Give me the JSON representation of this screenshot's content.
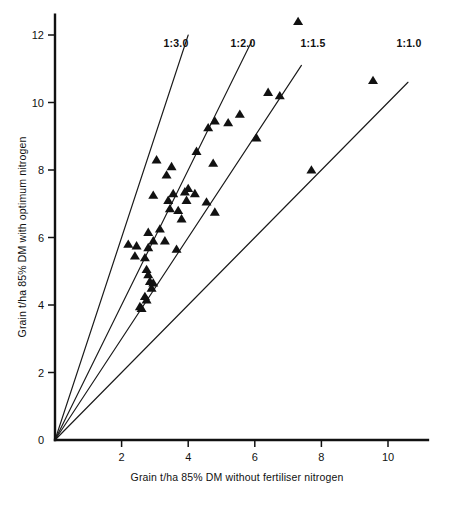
{
  "chart_data": {
    "type": "scatter",
    "title": "",
    "xlabel": "Grain t/ha 85% DM without fertiliser nitrogen",
    "ylabel": "Grain t/ha 85% DM with optimum nitrogen",
    "xlim": [
      0,
      11.2
    ],
    "ylim": [
      0,
      12.6
    ],
    "xticks": [
      0,
      2,
      4,
      6,
      8,
      10
    ],
    "yticks": [
      0,
      2,
      4,
      6,
      8,
      10,
      12
    ],
    "xtick_labels": [
      "0",
      "2",
      "4",
      "6",
      "8",
      "10"
    ],
    "ytick_labels": [
      "0",
      "2",
      "4",
      "6",
      "8",
      "10",
      "12"
    ],
    "grid": false,
    "legend": false,
    "marker": "triangle-up",
    "marker_color": "#111111",
    "series": [
      {
        "name": "Sites",
        "points": [
          [
            7.3,
            12.4
          ],
          [
            9.55,
            10.65
          ],
          [
            6.4,
            10.3
          ],
          [
            6.75,
            10.2
          ],
          [
            5.55,
            9.65
          ],
          [
            4.8,
            9.45
          ],
          [
            5.2,
            9.4
          ],
          [
            4.6,
            9.25
          ],
          [
            6.05,
            8.95
          ],
          [
            4.25,
            8.55
          ],
          [
            3.05,
            8.3
          ],
          [
            4.75,
            8.2
          ],
          [
            3.5,
            8.1
          ],
          [
            3.35,
            7.85
          ],
          [
            7.7,
            8.0
          ],
          [
            4.0,
            7.45
          ],
          [
            3.9,
            7.35
          ],
          [
            4.2,
            7.3
          ],
          [
            2.95,
            7.25
          ],
          [
            3.55,
            7.3
          ],
          [
            3.4,
            7.1
          ],
          [
            3.95,
            7.1
          ],
          [
            4.55,
            7.05
          ],
          [
            3.45,
            6.85
          ],
          [
            3.7,
            6.8
          ],
          [
            4.8,
            6.75
          ],
          [
            3.8,
            6.55
          ],
          [
            2.8,
            6.15
          ],
          [
            3.15,
            6.25
          ],
          [
            2.95,
            5.9
          ],
          [
            3.3,
            5.9
          ],
          [
            2.2,
            5.8
          ],
          [
            2.45,
            5.75
          ],
          [
            2.8,
            5.7
          ],
          [
            3.65,
            5.65
          ],
          [
            2.4,
            5.45
          ],
          [
            2.7,
            5.4
          ],
          [
            2.75,
            5.05
          ],
          [
            2.8,
            4.9
          ],
          [
            2.85,
            4.7
          ],
          [
            2.95,
            4.65
          ],
          [
            2.9,
            4.5
          ],
          [
            2.7,
            4.25
          ],
          [
            2.75,
            4.15
          ],
          [
            2.55,
            3.95
          ],
          [
            2.6,
            3.9
          ]
        ]
      }
    ],
    "reference_lines": [
      {
        "label": "1:3.0",
        "ratio": 3.0,
        "label_x": 176,
        "label_y": 47,
        "x_end": 4.0
      },
      {
        "label": "1:2.0",
        "ratio": 2.0,
        "label_x": 243,
        "label_y": 47,
        "x_end": 5.9
      },
      {
        "label": "1:1.5",
        "ratio": 1.5,
        "label_x": 313,
        "label_y": 47,
        "x_end": 7.4
      },
      {
        "label": "1:1.0",
        "ratio": 1.0,
        "label_x": 409,
        "label_y": 47,
        "x_end": 10.6
      }
    ]
  }
}
